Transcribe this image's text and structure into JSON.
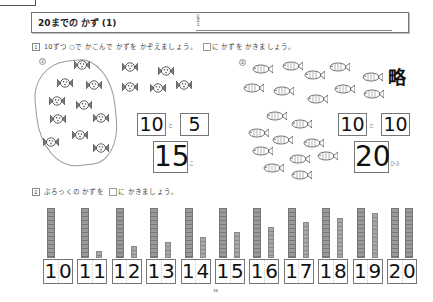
{
  "header": {
    "title": "20までの かず (1)",
    "name_label": "なまえ"
  },
  "section1": {
    "number": "1",
    "instruction_part1": "10ずつ ○で かこんで かずを かぞえましょう。",
    "instruction_part2": "に かずを かきましょう。",
    "problem1": {
      "label": "①",
      "item": "candy",
      "grouped_count": 10,
      "extra_count": 5,
      "answer_tens": "10",
      "connector": "と",
      "answer_ones": "5",
      "total": "15",
      "unit": "こ"
    },
    "problem2": {
      "label": "②",
      "item": "fish",
      "omitted_mark": "略",
      "answer_tens": "10",
      "connector": "と",
      "answer_ones": "10",
      "total": "20",
      "unit": "ひき"
    }
  },
  "section2": {
    "number": "2",
    "instruction_part1": "ぶろっくの かずを",
    "instruction_part2": "に かきましょう。",
    "blocks": [
      {
        "tens": 1,
        "ones": 0,
        "digits": [
          "1",
          "0"
        ]
      },
      {
        "tens": 1,
        "ones": 1,
        "digits": [
          "1",
          "1"
        ]
      },
      {
        "tens": 1,
        "ones": 2,
        "digits": [
          "1",
          "2"
        ]
      },
      {
        "tens": 1,
        "ones": 3,
        "digits": [
          "1",
          "3"
        ]
      },
      {
        "tens": 1,
        "ones": 4,
        "digits": [
          "1",
          "4"
        ]
      },
      {
        "tens": 1,
        "ones": 5,
        "digits": [
          "1",
          "5"
        ]
      },
      {
        "tens": 1,
        "ones": 6,
        "digits": [
          "1",
          "6"
        ]
      },
      {
        "tens": 1,
        "ones": 7,
        "digits": [
          "1",
          "7"
        ]
      },
      {
        "tens": 1,
        "ones": 8,
        "digits": [
          "1",
          "8"
        ]
      },
      {
        "tens": 1,
        "ones": 9,
        "digits": [
          "1",
          "9"
        ]
      },
      {
        "tens": 2,
        "ones": 0,
        "digits": [
          "2",
          "0"
        ]
      }
    ]
  },
  "page_number": "48",
  "colors": {
    "ink": "#111111",
    "block_fill": "#9a9a9a",
    "border": "#777777"
  }
}
